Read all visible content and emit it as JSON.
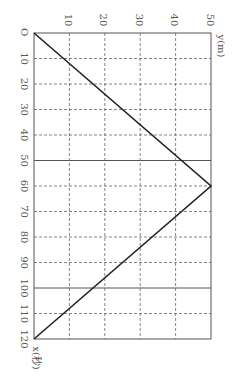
{
  "chart_data": {
    "type": "line",
    "title": "",
    "orientation": "rotated 90° clockwise (x-axis runs downward, y-axis runs rightward)",
    "xlabel": "x(秒)",
    "ylabel": "y(m)",
    "origin_label": "O",
    "x_ticks": [
      10,
      20,
      30,
      40,
      50,
      60,
      70,
      80,
      90,
      100,
      110,
      120
    ],
    "y_ticks": [
      10,
      20,
      30,
      40,
      50
    ],
    "xlim": [
      0,
      120
    ],
    "ylim": [
      0,
      50
    ],
    "grid": true,
    "solid_gridlines_x": [
      50,
      100
    ],
    "series": [
      {
        "name": "y",
        "x": [
          0,
          60,
          120
        ],
        "values": [
          0,
          50,
          0
        ]
      }
    ]
  },
  "labels": {
    "origin": "O",
    "x_axis": "x(秒)",
    "y_axis": "y(m)"
  }
}
